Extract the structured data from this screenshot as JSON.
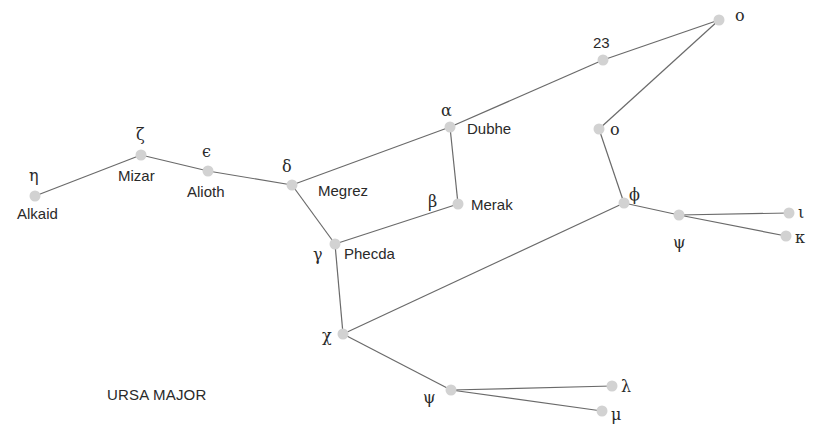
{
  "title": "URSA MAJOR",
  "colors": {
    "line": "#6a6a6a",
    "star": "#d2d2d2",
    "text": "#2a2a2a",
    "background": "#ffffff"
  },
  "stars": [
    {
      "id": "alkaid",
      "symbol": "η",
      "name": "Alkaid",
      "x": 35,
      "y": 196
    },
    {
      "id": "mizar",
      "symbol": "ζ",
      "name": "Mizar",
      "x": 141,
      "y": 155
    },
    {
      "id": "alioth",
      "symbol": "ϵ",
      "name": "Alioth",
      "x": 208,
      "y": 171
    },
    {
      "id": "megrez",
      "symbol": "δ",
      "name": "Megrez",
      "x": 292,
      "y": 185
    },
    {
      "id": "dubhe",
      "symbol": "α",
      "name": "Dubhe",
      "x": 450,
      "y": 127
    },
    {
      "id": "merak",
      "symbol": "β",
      "name": "Merak",
      "x": 458,
      "y": 204
    },
    {
      "id": "phecda",
      "symbol": "γ",
      "name": "Phecda",
      "x": 335,
      "y": 244
    },
    {
      "id": "s23",
      "symbol": "23",
      "name": "",
      "x": 603,
      "y": 60
    },
    {
      "id": "omicron_top",
      "symbol": "o",
      "name": "",
      "x": 719,
      "y": 20
    },
    {
      "id": "omicron_mid",
      "symbol": "o",
      "name": "",
      "x": 599,
      "y": 129
    },
    {
      "id": "phi",
      "symbol": "ϕ",
      "name": "",
      "x": 624,
      "y": 203
    },
    {
      "id": "psi_right",
      "symbol": "ψ",
      "name": "",
      "x": 679,
      "y": 215
    },
    {
      "id": "iota",
      "symbol": "ι",
      "name": "",
      "x": 789,
      "y": 213
    },
    {
      "id": "kappa",
      "symbol": "κ",
      "name": "",
      "x": 786,
      "y": 236
    },
    {
      "id": "chi",
      "symbol": "χ",
      "name": "",
      "x": 343,
      "y": 334
    },
    {
      "id": "psi_bottom",
      "symbol": "ψ",
      "name": "",
      "x": 451,
      "y": 390
    },
    {
      "id": "lambda",
      "symbol": "λ",
      "name": "",
      "x": 612,
      "y": 386
    },
    {
      "id": "mu",
      "symbol": "μ",
      "name": "",
      "x": 602,
      "y": 411
    }
  ],
  "connections": [
    [
      "alkaid",
      "mizar"
    ],
    [
      "mizar",
      "alioth"
    ],
    [
      "alioth",
      "megrez"
    ],
    [
      "megrez",
      "dubhe"
    ],
    [
      "dubhe",
      "merak"
    ],
    [
      "merak",
      "phecda"
    ],
    [
      "phecda",
      "megrez"
    ],
    [
      "dubhe",
      "s23"
    ],
    [
      "s23",
      "omicron_top"
    ],
    [
      "omicron_top",
      "omicron_mid"
    ],
    [
      "omicron_mid",
      "phi"
    ],
    [
      "phi",
      "psi_right"
    ],
    [
      "psi_right",
      "iota"
    ],
    [
      "psi_right",
      "kappa"
    ],
    [
      "phi",
      "chi"
    ],
    [
      "phecda",
      "chi"
    ],
    [
      "chi",
      "psi_bottom"
    ],
    [
      "psi_bottom",
      "lambda"
    ],
    [
      "psi_bottom",
      "mu"
    ]
  ]
}
